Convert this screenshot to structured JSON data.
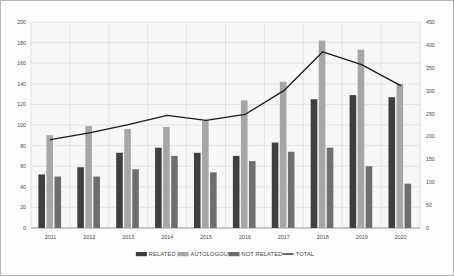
{
  "chart_data": {
    "type": "bar",
    "title": "",
    "xlabel": "",
    "ylabel": "",
    "categories": [
      "2011",
      "2012",
      "2013",
      "2014",
      "2015",
      "2016",
      "2017",
      "2018",
      "2019",
      "2020"
    ],
    "series": [
      {
        "name": "RELATED",
        "type": "bar",
        "axis": "left",
        "color": "#3f3f3f",
        "values": [
          52,
          59,
          73,
          78,
          73,
          70,
          83,
          125,
          129,
          127
        ]
      },
      {
        "name": "AUTOLOGOUS",
        "type": "bar",
        "axis": "left",
        "color": "#a6a6a6",
        "values": [
          90,
          99,
          96,
          98,
          104,
          124,
          142,
          182,
          173,
          140
        ]
      },
      {
        "name": "NOT RELATED",
        "type": "bar",
        "axis": "left",
        "color": "#6e6e6e",
        "values": [
          50,
          50,
          57,
          70,
          54,
          65,
          74,
          78,
          60,
          43
        ]
      },
      {
        "name": "TOTAL",
        "type": "line",
        "axis": "right",
        "color": "#1a1a1a",
        "values": [
          193,
          208,
          226,
          246,
          235,
          248,
          300,
          385,
          357,
          311
        ]
      }
    ],
    "left_axis": {
      "min": 0,
      "max": 200,
      "step": 20,
      "ticks": [
        "0",
        "20",
        "40",
        "60",
        "80",
        "100",
        "120",
        "140",
        "160",
        "180",
        "200"
      ]
    },
    "right_axis": {
      "min": 0,
      "max": 450,
      "step": 50,
      "ticks": [
        "0",
        "50",
        "100",
        "150",
        "200",
        "250",
        "300",
        "350",
        "400",
        "450"
      ]
    },
    "grid": true,
    "legend_position": "bottom",
    "legend": [
      {
        "label": "RELATED",
        "marker": "swatch",
        "color": "#3f3f3f"
      },
      {
        "label": "AUTOLOGOUS",
        "marker": "swatch",
        "color": "#a6a6a6"
      },
      {
        "label": "NOT RELATED",
        "marker": "swatch",
        "color": "#6e6e6e"
      },
      {
        "label": "TOTAL",
        "marker": "line",
        "color": "#1a1a1a"
      }
    ],
    "colors": {
      "background": "#fdfdfd",
      "plot_background": "#f7f7f7",
      "grid": "#d9d9d9",
      "border": "#b5b5b5",
      "axis_text": "#4a4a4a"
    }
  }
}
